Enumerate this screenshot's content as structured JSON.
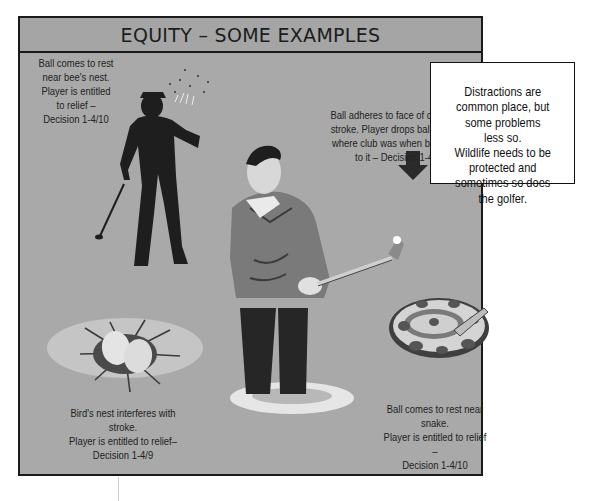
{
  "header": {
    "title": "EQUITY – SOME EXAMPLES"
  },
  "examples": [
    {
      "id": "bees-nest",
      "caption": "Ball comes to rest\nnear bee's nest.\nPlayer is entitled\nto relief –\nDecision 1-4/10"
    },
    {
      "id": "club-face",
      "caption": "Ball adheres to face of club after\nstroke. Player drops ball on spot\nwhere club was when ball stuck\nto it – Decision 1-4/2"
    },
    {
      "id": "birds-nest",
      "caption": "Bird's nest interferes with stroke.\nPlayer is entitled to relief–\nDecision 1-4/9"
    },
    {
      "id": "snake",
      "caption": "Ball comes to rest near snake.\nPlayer is entitled to relief –\nDecision 1-4/10"
    }
  ],
  "callout": {
    "text": "Distractions are\ncommon place, but\nsome problems\nless so.\nWildlife needs to be\nprotected and\nsometimes so does\nthe golfer."
  },
  "illustrations": {
    "bee_golfer": "golfer-silhouette-with-bees",
    "main_golfer": "golfer-with-ball-stuck-to-club",
    "arrow": "down-arrow-icon",
    "nest": "birds-nest-with-eggs",
    "snake": "coiled-snake"
  },
  "colors": {
    "panel": "#a9a9a9",
    "header": "#a5a5a5",
    "border": "#1a1a1a",
    "callout_bg": "#ffffff"
  }
}
